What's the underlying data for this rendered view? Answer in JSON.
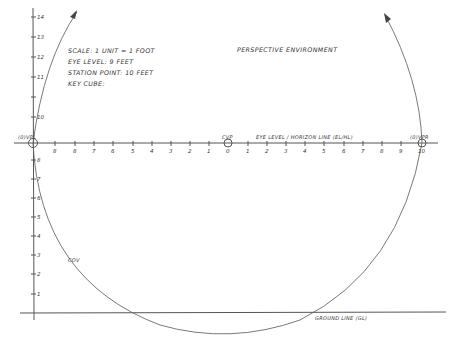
{
  "title": "PERSPECTIVE ENVIRONMENT",
  "notes": {
    "scale": "SCALE: 1 UNIT = 1 FOOT",
    "eye_level": "EYE LEVEL: 9 FEET",
    "station_point": "STATION POINT: 10 FEET",
    "key_cube": "KEY CUBE:"
  },
  "labels": {
    "left_vp": "(0)VPL",
    "center_vp": "CVP",
    "right_vp": "(0)VPR",
    "horizon": "EYE LEVEL / HORIZON LINE (EL/HL)",
    "ground": "GROUND LINE (GL)",
    "cov": "COV"
  },
  "vertical_ticks_above": [
    "14",
    "13",
    "12",
    "11",
    "10"
  ],
  "vertical_ticks_below": [
    "8",
    "7",
    "6",
    "5",
    "4",
    "3",
    "2",
    "1"
  ],
  "horizon_ticks_left": [
    "9",
    "8",
    "7",
    "6",
    "5",
    "4",
    "3",
    "2",
    "1"
  ],
  "horizon_center_tick": "0",
  "horizon_ticks_right": [
    "1",
    "2",
    "3",
    "4",
    "5",
    "6",
    "7",
    "8",
    "9"
  ],
  "horizon_end_tick": "10"
}
